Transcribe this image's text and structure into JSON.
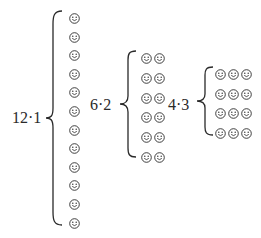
{
  "diagram": {
    "title": "",
    "groups": [
      {
        "label": "12·1",
        "rows": 12,
        "cols": 1
      },
      {
        "label": "6·2",
        "rows": 6,
        "cols": 2
      },
      {
        "label": "4·3",
        "rows": 4,
        "cols": 3
      }
    ],
    "item_icon": "smiley-face-icon",
    "colors": {
      "ink": "#2a2a2a",
      "background": "#ffffff"
    }
  }
}
